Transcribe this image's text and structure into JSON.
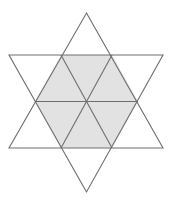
{
  "figure": {
    "name": "hexagram-star-of-david",
    "canvas": {
      "width": 172,
      "height": 204,
      "background": "#ffffff"
    },
    "style": {
      "stroke_color": "#6e6e6e",
      "stroke_width": 1.1,
      "shaded_fill": "#e2e2e2",
      "unshaded_fill": "#ffffff"
    },
    "geometry": {
      "center": {
        "x": 86,
        "y": 101.5
      },
      "star_points": {
        "top": {
          "x": 86.5,
          "y": 13
        },
        "upper_left": {
          "x": 9,
          "y": 55
        },
        "upper_right": {
          "x": 163,
          "y": 55
        },
        "lower_left": {
          "x": 9,
          "y": 148
        },
        "lower_right": {
          "x": 163,
          "y": 148
        },
        "bottom": {
          "x": 86.5,
          "y": 192
        }
      },
      "hexagon_vertices": [
        {
          "x": 61,
          "y": 55
        },
        {
          "x": 112,
          "y": 55
        },
        {
          "x": 138,
          "y": 101.5
        },
        {
          "x": 112,
          "y": 148
        },
        {
          "x": 61,
          "y": 148
        },
        {
          "x": 35,
          "y": 101.5
        }
      ],
      "triangle_up": "86.5,13 163,148 9,148",
      "triangle_down": "86.5,192 9,55 163,55"
    },
    "labels": {
      "shaded_region": "central hexagon",
      "inner_segment_count": 6,
      "star_point_count": 6
    }
  }
}
